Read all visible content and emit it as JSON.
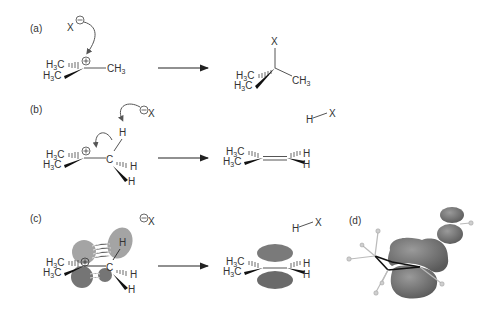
{
  "panels": [
    {
      "id": "a",
      "label": "(a)"
    },
    {
      "id": "b",
      "label": "(b)"
    },
    {
      "id": "c",
      "label": "(c)"
    },
    {
      "id": "d",
      "label": "(d)"
    }
  ],
  "atoms": {
    "x": "X",
    "h": "H",
    "c": "C",
    "ch3": "CH",
    "h3c_h": "H",
    "h3c_c": "C",
    "sub3": "3",
    "plus": "⊕",
    "minus": "⊖"
  },
  "reactions": [
    {
      "panel": "a",
      "reactant": "tert-butyl cation + X⁻",
      "product": "tert-butyl–X",
      "type": "nucleophilic capture"
    },
    {
      "panel": "b",
      "reactant": "carbocation + X⁻ (base)",
      "product": "alkene + H–X",
      "type": "E1 elimination"
    },
    {
      "panel": "c",
      "reactant": "hyperconjugation orbital overlap",
      "product": "π bond + H–X",
      "type": "orbital picture"
    },
    {
      "panel": "d",
      "description": "computed orbital surface"
    }
  ],
  "colors": {
    "orbital_light": "#9a9a9a",
    "orbital_dark": "#6e6e6e",
    "orbital_d": "#7a7a7a",
    "bond": "#333333",
    "background": "#ffffff"
  }
}
